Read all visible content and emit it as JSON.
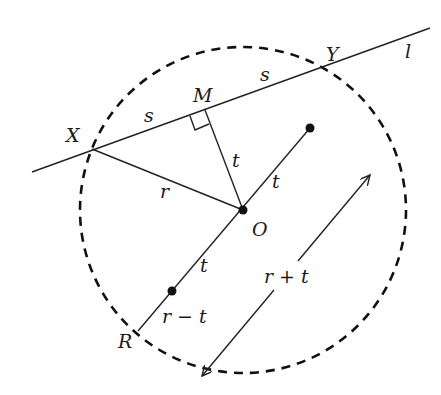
{
  "diagram": {
    "labels": {
      "X": "X",
      "Y": "Y",
      "M": "M",
      "O": "O",
      "R": "R",
      "l": "l",
      "s_left": "s",
      "s_right": "s",
      "r": "r",
      "t_MO": "t",
      "t_upper": "t",
      "t_lower": "t",
      "r_plus_t": "r + t",
      "r_minus_t": "r − t"
    },
    "geometry": {
      "circle": {
        "cx": 243,
        "cy": 210,
        "r": 163,
        "style": "dashed"
      },
      "line_l": {
        "x1": 32,
        "y1": 172,
        "x2": 430,
        "y2": 28
      },
      "points": {
        "X": [
          92,
          149
        ],
        "Y": [
          320,
          68
        ],
        "M": [
          205,
          110
        ],
        "O": [
          243,
          210
        ],
        "R": [
          138,
          331
        ],
        "dot_upper": [
          310,
          128
        ],
        "dot_lower": [
          172,
          291
        ]
      },
      "arrow_r_plus_t": {
        "x1": 202,
        "y1": 376,
        "x2": 370,
        "y2": 175,
        "double_headed": true
      }
    },
    "colors": {
      "stroke": "#222222",
      "background": "#ffffff"
    }
  }
}
